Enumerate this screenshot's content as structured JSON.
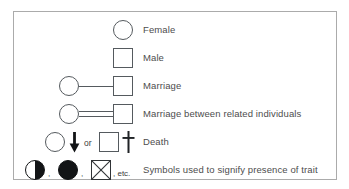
{
  "diagram": {
    "frame_border_color": "#ababab",
    "symbol_outline_color": "#555a5e",
    "symbol_fill_color": "#121416",
    "label_color": "#4d4d4d",
    "background_color": "#ffffff",
    "rows": [
      {
        "id": "female",
        "label": "Female",
        "symbols": [
          "open-circle"
        ]
      },
      {
        "id": "male",
        "label": "Male",
        "symbols": [
          "open-square"
        ]
      },
      {
        "id": "marriage",
        "label": "Marriage",
        "symbols": [
          "open-circle",
          "single-horizontal-line",
          "open-square"
        ]
      },
      {
        "id": "consanguineous-marriage",
        "label": "Marriage between related individuals",
        "symbols": [
          "open-circle",
          "double-horizontal-line",
          "open-square"
        ]
      },
      {
        "id": "death",
        "label": "Death",
        "connector_text": "or",
        "symbols": [
          "open-circle",
          "down-arrow",
          "open-square",
          "cross"
        ]
      },
      {
        "id": "trait-presence",
        "label": "Symbols used to signify presence of trait",
        "separator": ",",
        "etc_text": ", etc.",
        "symbols": [
          "half-filled-circle",
          "filled-circle",
          "crossed-square"
        ]
      }
    ]
  }
}
